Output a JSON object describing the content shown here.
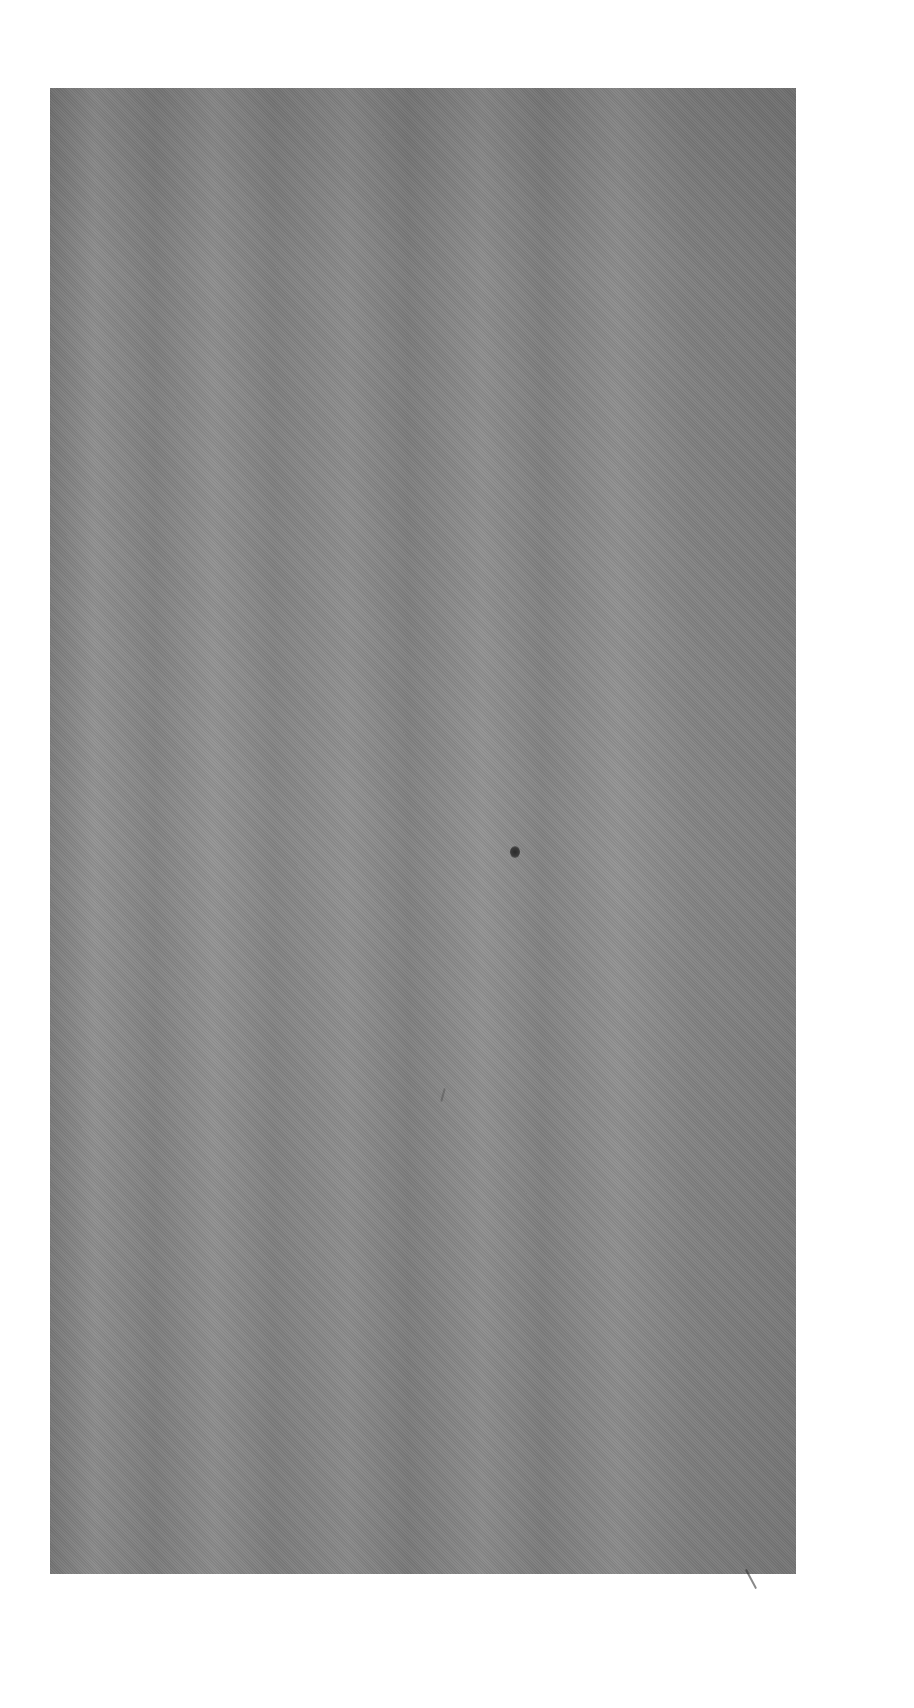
{
  "image": {
    "description": "Scanned gray textured surface with a small dark spot",
    "background_color": "#ffffff",
    "surface_color": "#8a8a8a",
    "spot_color": "#2e2e2e"
  }
}
